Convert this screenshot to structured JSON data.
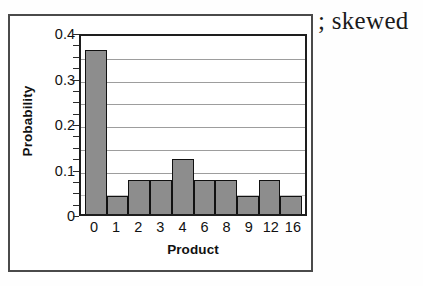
{
  "caption": "; skewed",
  "chart_data": {
    "type": "bar",
    "title": "",
    "xlabel": "Product",
    "ylabel": "Probability",
    "categories": [
      "0",
      "1",
      "2",
      "3",
      "4",
      "6",
      "8",
      "9",
      "12",
      "16"
    ],
    "values": [
      0.36,
      0.04,
      0.075,
      0.075,
      0.12,
      0.075,
      0.075,
      0.04,
      0.075,
      0.04
    ],
    "ylim": [
      0,
      0.4
    ],
    "ytick_labels": [
      "0.4",
      "0.3",
      "0.2",
      "0.1",
      "0"
    ],
    "ytick_values": [
      0.4,
      0.3,
      0.2,
      0.1,
      0
    ],
    "gridlines": [
      0.35,
      0.3,
      0.25,
      0.2,
      0.15,
      0.1,
      0.05
    ],
    "grid": true,
    "legend": "none",
    "bar_color": "#8d8d8d",
    "bar_edge_color": "#111111",
    "axis_color": "#1e1e1e",
    "frame_color": "#4a4a4a"
  }
}
